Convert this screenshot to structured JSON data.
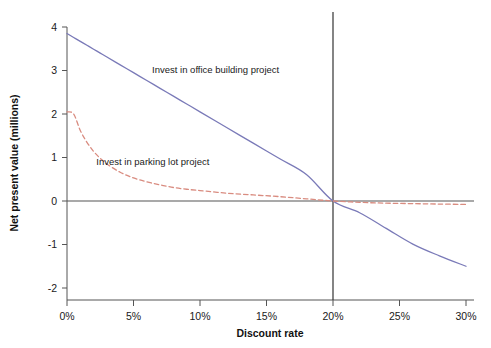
{
  "chart_data": {
    "type": "line",
    "title": "",
    "xlabel": "Discount rate",
    "ylabel": "Net present value (millions)",
    "xlim": [
      0,
      30
    ],
    "ylim": [
      -2,
      4
    ],
    "grid": false,
    "legend_position": "inline-annotations",
    "x_tick_labels": [
      "0%",
      "5%",
      "10%",
      "15%",
      "20%",
      "25%",
      "30%"
    ],
    "x_tick_values": [
      0,
      5,
      10,
      15,
      20,
      25,
      30
    ],
    "y_tick_labels": [
      "-2",
      "-1",
      "0",
      "1",
      "2",
      "3",
      "4"
    ],
    "y_tick_values": [
      -2,
      -1,
      0,
      1,
      2,
      3,
      4
    ],
    "x": [
      0,
      0.5,
      1,
      1.5,
      2,
      2.5,
      3,
      4,
      5,
      6,
      7,
      8,
      9,
      10,
      12,
      14,
      16,
      18,
      20,
      22,
      24,
      26,
      28,
      30
    ],
    "series": [
      {
        "name": "Invest in office building project",
        "style": "solid",
        "color": "#7a7ab8",
        "values": [
          3.85,
          3.76,
          3.67,
          3.58,
          3.49,
          3.4,
          3.31,
          3.13,
          2.95,
          2.77,
          2.59,
          2.41,
          2.23,
          2.05,
          1.69,
          1.33,
          0.97,
          0.61,
          0.0,
          -0.27,
          -0.63,
          -0.99,
          -1.26,
          -1.5
        ]
      },
      {
        "name": "Invest in parking lot project",
        "style": "dashed",
        "color": "#d98c80",
        "values": [
          2.05,
          2.0,
          1.62,
          1.35,
          1.14,
          0.98,
          0.85,
          0.66,
          0.53,
          0.44,
          0.37,
          0.31,
          0.27,
          0.24,
          0.18,
          0.14,
          0.1,
          0.05,
          0.0,
          -0.03,
          -0.05,
          -0.06,
          -0.07,
          -0.08
        ]
      }
    ],
    "annotations": [
      {
        "text": "Invest in office building project",
        "x": 6.4,
        "y": 2.95
      },
      {
        "text": "Invest in parking lot project",
        "x": 2.2,
        "y": 0.83
      }
    ],
    "reference_lines": [
      {
        "orientation": "vertical",
        "value": 20,
        "color": "#333333"
      },
      {
        "orientation": "horizontal",
        "value": 0,
        "color": "#555555"
      }
    ],
    "axis_color": "#555555"
  }
}
